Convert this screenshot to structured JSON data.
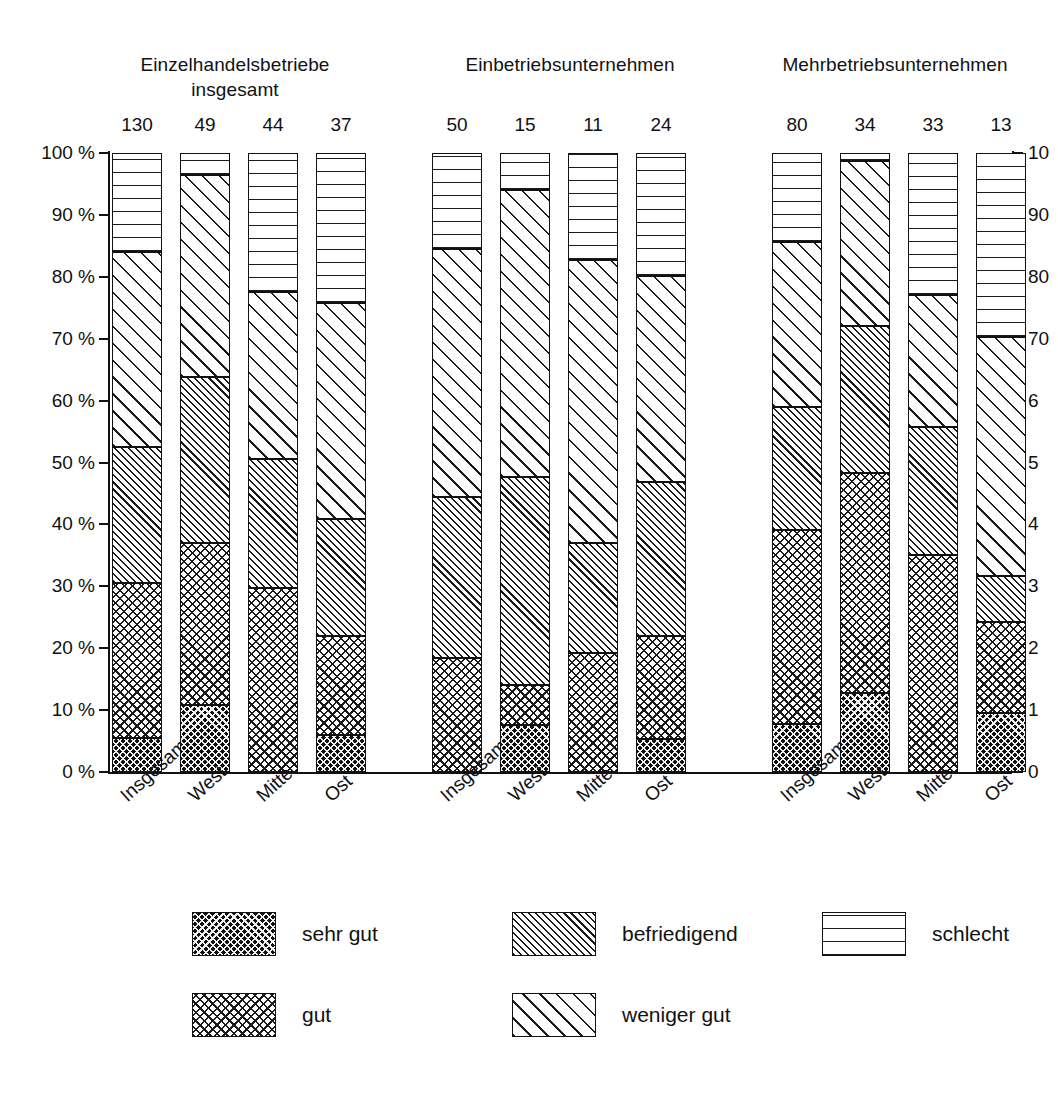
{
  "chart_data": {
    "type": "bar",
    "subtype": "stacked-percentage",
    "title": "",
    "xlabel": "",
    "ylabel": "",
    "ylim": [
      0,
      100
    ],
    "y_unit": "%",
    "grid": false,
    "legend_position": "bottom",
    "y_ticks": [
      "0 %",
      "10 %",
      "20 %",
      "30 %",
      "40 %",
      "50 %",
      "60 %",
      "70 %",
      "80 %",
      "90 %",
      "100 %"
    ],
    "y_ticks_right": [
      "0",
      "1",
      "2",
      "3",
      "4",
      "5",
      "6",
      "70",
      "80",
      "90",
      "10"
    ],
    "series": [
      {
        "name": "sehr gut",
        "pattern": "dark-crosshatch"
      },
      {
        "name": "gut",
        "pattern": "light-crosshatch"
      },
      {
        "name": "befriedigend",
        "pattern": "dense-diagonal"
      },
      {
        "name": "weniger gut",
        "pattern": "sparse-diagonal"
      },
      {
        "name": "schlecht",
        "pattern": "horizontal-lines"
      }
    ],
    "groups": [
      {
        "title": "Einzelhandelsbetriebe\ninsgesamt",
        "categories": [
          "Insgesamt",
          "West",
          "Mitte",
          "Ost"
        ],
        "counts": [
          130,
          49,
          44,
          37
        ],
        "values": [
          {
            "sehr gut": 5.5,
            "gut": 25.0,
            "befriedigend": 22.0,
            "weniger gut": 31.5,
            "schlecht": 16.0
          },
          {
            "sehr gut": 10.8,
            "gut": 26.2,
            "befriedigend": 26.8,
            "weniger gut": 32.7,
            "schlecht": 3.5
          },
          {
            "sehr gut": 0.0,
            "gut": 29.8,
            "befriedigend": 20.7,
            "weniger gut": 27.0,
            "schlecht": 22.5
          },
          {
            "sehr gut": 5.9,
            "gut": 16.1,
            "befriedigend": 18.8,
            "weniger gut": 35.0,
            "schlecht": 24.2
          }
        ]
      },
      {
        "title": "Einbetriebsunternehmen",
        "categories": [
          "Insgesamt",
          "West",
          "Mitte",
          "Ost"
        ],
        "counts": [
          50,
          15,
          11,
          24
        ],
        "values": [
          {
            "sehr gut": 0.0,
            "gut": 18.5,
            "befriedigend": 26.0,
            "weniger gut": 40.0,
            "schlecht": 15.5
          },
          {
            "sehr gut": 7.6,
            "gut": 6.5,
            "befriedigend": 33.5,
            "weniger gut": 46.4,
            "schlecht": 6.0
          },
          {
            "sehr gut": 0.0,
            "gut": 19.2,
            "befriedigend": 17.8,
            "weniger gut": 45.7,
            "schlecht": 17.3
          },
          {
            "sehr gut": 5.4,
            "gut": 16.6,
            "befriedigend": 24.8,
            "weniger gut": 33.4,
            "schlecht": 19.8
          }
        ]
      },
      {
        "title": "Mehrbetriebsunternehmen",
        "categories": [
          "Insgesamt",
          "West",
          "Mitte",
          "Ost"
        ],
        "counts": [
          80,
          34,
          33,
          13
        ],
        "values": [
          {
            "sehr gut": 7.8,
            "gut": 31.3,
            "befriedigend": 19.8,
            "weniger gut": 26.7,
            "schlecht": 14.4
          },
          {
            "sehr gut": 12.7,
            "gut": 35.6,
            "befriedigend": 23.7,
            "weniger gut": 26.7,
            "schlecht": 1.3
          },
          {
            "sehr gut": 0.0,
            "gut": 35.0,
            "befriedigend": 20.8,
            "weniger gut": 21.2,
            "schlecht": 23.0
          },
          {
            "sehr gut": 9.5,
            "gut": 14.7,
            "befriedigend": 7.5,
            "weniger gut": 38.5,
            "schlecht": 29.8
          }
        ]
      }
    ],
    "legend": [
      {
        "label": "sehr gut",
        "key": "sehr gut"
      },
      {
        "label": "befriedigend",
        "key": "befriedigend"
      },
      {
        "label": "schlecht",
        "key": "schlecht"
      },
      {
        "label": "gut",
        "key": "gut"
      },
      {
        "label": "weniger gut",
        "key": "weniger gut"
      }
    ]
  }
}
